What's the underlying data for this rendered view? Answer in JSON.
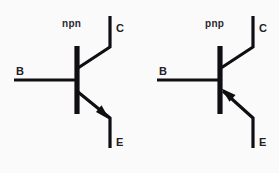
{
  "figure": {
    "background_color": "#fbfafb",
    "ink_color": "#100e13",
    "width": 279,
    "height": 173
  },
  "symbols": [
    {
      "id": "npn",
      "type_label": "npn",
      "arrow_direction": "outward",
      "arrow_on": "emitter",
      "terminals": {
        "collector": "C",
        "base": "B",
        "emitter": "E"
      },
      "geometry": {
        "bar_x": 77,
        "bar_y_top": 47,
        "bar_y_bottom": 113,
        "base_lead_x_start": 14,
        "base_lead_y": 80,
        "collector_elbow_x": 110,
        "collector_elbow_y": 47,
        "collector_end_y": 16,
        "collector_junction_y": 68,
        "emitter_junction_y": 92,
        "emitter_elbow_x": 110,
        "emitter_elbow_y": 118,
        "emitter_end_y": 148
      },
      "labels": {
        "type_x": 62,
        "type_y": 27,
        "collector_x": 116,
        "collector_y": 32,
        "base_x": 16,
        "base_y": 75,
        "emitter_x": 116,
        "emitter_y": 146
      }
    },
    {
      "id": "pnp",
      "type_label": "pnp",
      "arrow_direction": "inward",
      "arrow_on": "emitter",
      "terminals": {
        "collector": "C",
        "base": "B",
        "emitter": "E"
      },
      "geometry": {
        "bar_x": 220,
        "bar_y_top": 47,
        "bar_y_bottom": 113,
        "base_lead_x_start": 157,
        "base_lead_y": 80,
        "collector_elbow_x": 253,
        "collector_elbow_y": 47,
        "collector_end_y": 16,
        "collector_junction_y": 68,
        "emitter_junction_y": 92,
        "emitter_elbow_x": 253,
        "emitter_elbow_y": 118,
        "emitter_end_y": 148
      },
      "labels": {
        "type_x": 205,
        "type_y": 27,
        "collector_x": 259,
        "collector_y": 32,
        "base_x": 159,
        "base_y": 75,
        "emitter_x": 259,
        "emitter_y": 146
      }
    }
  ]
}
